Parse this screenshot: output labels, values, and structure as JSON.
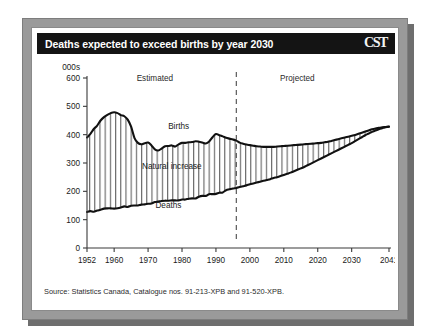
{
  "figure": {
    "title": "Deaths expected to exceed births by year 2030",
    "logo": "CST",
    "source": "Source: Statistics Canada, Catalogue nos. 91-213-XPB and 91-520-XPB."
  },
  "chart_data": {
    "type": "area",
    "title": "Deaths expected to exceed births by year 2030",
    "xlabel": "",
    "ylabel": "000s",
    "yunits_label": "000s",
    "xlim": [
      1952,
      2041
    ],
    "ylim": [
      0,
      600
    ],
    "yticks": [
      0,
      100,
      200,
      300,
      400,
      500,
      600
    ],
    "ytick_labels": [
      "0",
      "100",
      "200",
      "300",
      "400",
      "500",
      "600"
    ],
    "xticks": [
      1952,
      1960,
      1970,
      1980,
      1990,
      2000,
      2010,
      2020,
      2030,
      2041
    ],
    "xtick_labels": [
      "1952",
      "1960",
      "1970",
      "1980",
      "1990",
      "2000",
      "2010",
      "2020",
      "2030",
      "2041"
    ],
    "grid": false,
    "legend_position": "inline-annotations",
    "annotations": [
      {
        "text": "Estimated",
        "x": 1972,
        "y": 590,
        "name": "estimated-region-label"
      },
      {
        "text": "Projected",
        "x": 2014,
        "y": 590,
        "name": "projected-region-label"
      },
      {
        "text": "Births",
        "x": 1979,
        "y": 420,
        "name": "births-series-label"
      },
      {
        "text": "Natural increase",
        "x": 1977,
        "y": 280,
        "name": "natural-increase-label"
      },
      {
        "text": "Deaths",
        "x": 1976,
        "y": 140,
        "name": "deaths-series-label"
      }
    ],
    "divider": {
      "type": "dashed-vline",
      "x": 1996,
      "label": "estimated-projected-divider"
    },
    "fill_label": "Natural increase",
    "fill_pattern": "vertical-hatch",
    "x": [
      1952,
      1953,
      1954,
      1955,
      1956,
      1957,
      1958,
      1959,
      1960,
      1961,
      1962,
      1963,
      1964,
      1965,
      1966,
      1967,
      1968,
      1969,
      1970,
      1971,
      1972,
      1973,
      1974,
      1975,
      1976,
      1977,
      1978,
      1979,
      1980,
      1981,
      1982,
      1983,
      1984,
      1985,
      1986,
      1987,
      1988,
      1989,
      1990,
      1991,
      1992,
      1993,
      1994,
      1995,
      1996,
      1997,
      1998,
      1999,
      2000,
      2001,
      2002,
      2003,
      2004,
      2005,
      2006,
      2007,
      2008,
      2009,
      2010,
      2011,
      2012,
      2013,
      2014,
      2015,
      2016,
      2017,
      2018,
      2019,
      2020,
      2021,
      2022,
      2023,
      2024,
      2025,
      2026,
      2027,
      2028,
      2029,
      2030,
      2031,
      2032,
      2033,
      2034,
      2035,
      2036,
      2037,
      2038,
      2039,
      2040,
      2041
    ],
    "series": [
      {
        "name": "Births",
        "color": "#1a1a1a",
        "values": [
          390,
          403,
          420,
          432,
          450,
          462,
          470,
          476,
          479,
          476,
          469,
          465,
          453,
          428,
          388,
          371,
          366,
          370,
          372,
          362,
          348,
          344,
          351,
          359,
          360,
          362,
          358,
          366,
          371,
          371,
          373,
          374,
          377,
          375,
          372,
          369,
          376,
          391,
          402,
          398,
          394,
          389,
          386,
          383,
          379,
          372,
          368,
          365,
          363,
          361,
          359,
          358,
          357,
          357,
          357,
          357,
          358,
          359,
          360,
          361,
          362,
          363,
          364,
          365,
          366,
          367,
          368,
          369,
          370,
          371,
          373,
          375,
          378,
          381,
          384,
          387,
          390,
          393,
          396,
          399,
          403,
          407,
          411,
          415,
          419,
          422,
          424,
          426,
          427,
          428
        ]
      },
      {
        "name": "Deaths",
        "color": "#1a1a1a",
        "values": [
          127,
          130,
          128,
          132,
          135,
          139,
          140,
          140,
          139,
          140,
          143,
          147,
          145,
          149,
          150,
          150,
          153,
          154,
          156,
          157,
          162,
          164,
          166,
          167,
          167,
          168,
          168,
          168,
          171,
          171,
          174,
          175,
          175,
          181,
          184,
          184,
          190,
          190,
          191,
          195,
          196,
          204,
          207,
          210,
          212,
          215,
          218,
          221,
          225,
          228,
          231,
          234,
          237,
          240,
          243,
          247,
          250,
          254,
          258,
          262,
          266,
          271,
          276,
          281,
          286,
          292,
          298,
          304,
          310,
          316,
          322,
          328,
          334,
          340,
          346,
          352,
          358,
          364,
          370,
          377,
          384,
          391,
          398,
          404,
          410,
          415,
          419,
          423,
          426,
          429
        ]
      }
    ]
  }
}
